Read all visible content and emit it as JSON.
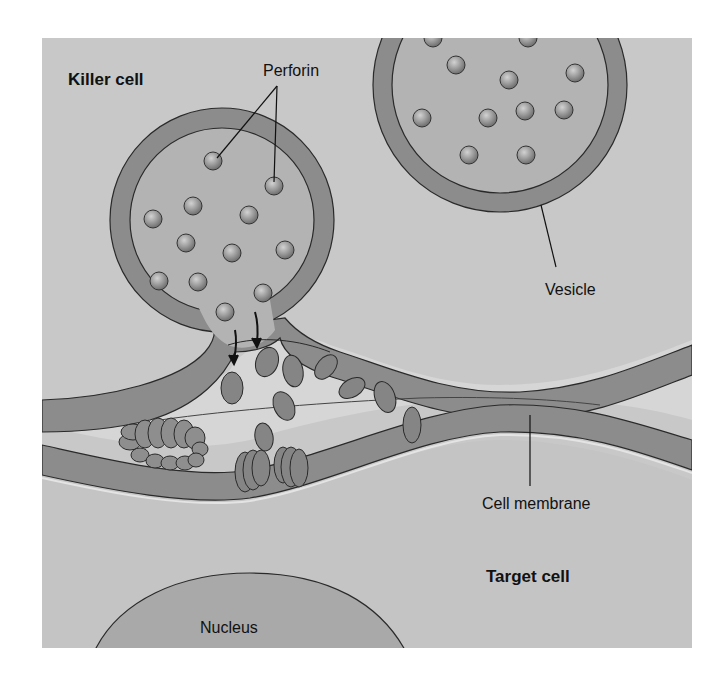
{
  "diagram": {
    "labels": {
      "killer_cell": "Killer cell",
      "perforin": "Perforin",
      "vesicle": "Vesicle",
      "cell_membrane": "Cell membrane",
      "target_cell": "Target cell",
      "nucleus": "Nucleus"
    },
    "colors": {
      "background": "#c8c8c8",
      "membrane": "#8c8c8c",
      "vesicle_interior": "#b3b3b3",
      "synaptic_cleft": "#d6d6d6",
      "target_cytoplasm": "#c4c4c4",
      "perforin_granule": "#9a9a9a",
      "pore_protein": "#858585",
      "nucleus": "#a9a9a9",
      "outline": "#2a2a2a"
    },
    "components": [
      "killer-cell",
      "secretory-vesicle-fusing",
      "secretory-vesicle",
      "perforin-granules",
      "released-perforin-monomers",
      "perforin-pore",
      "polymerized-perforin-complex",
      "target-cell-membrane",
      "target-cell",
      "nucleus"
    ]
  }
}
